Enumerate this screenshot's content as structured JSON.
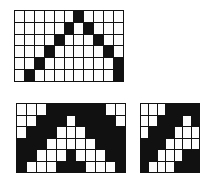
{
  "figure": {
    "colors": {
      "on": "#111111",
      "off": "#fdfdfd",
      "background": "#ffffff",
      "gridline": "#111111"
    },
    "legend": {
      "on_label": "filled cell",
      "off_label": "empty cell"
    },
    "grids": [
      {
        "name": "tent-outline",
        "caption": "",
        "columns": 11,
        "rows": 6,
        "cells": [
          [
            0,
            0,
            0,
            0,
            0,
            0,
            1,
            0,
            0,
            0,
            0
          ],
          [
            0,
            0,
            0,
            0,
            0,
            1,
            0,
            1,
            0,
            0,
            0
          ],
          [
            0,
            0,
            0,
            0,
            1,
            0,
            0,
            0,
            1,
            0,
            0
          ],
          [
            0,
            0,
            0,
            1,
            0,
            0,
            0,
            0,
            0,
            1,
            0
          ],
          [
            0,
            0,
            1,
            0,
            0,
            0,
            0,
            0,
            0,
            0,
            1
          ],
          [
            0,
            1,
            0,
            0,
            0,
            0,
            0,
            0,
            0,
            0,
            1
          ]
        ]
      },
      {
        "name": "tent-filled-inverse",
        "caption": "",
        "columns": 11,
        "rows": 6,
        "cells": [
          [
            0,
            0,
            0,
            1,
            1,
            1,
            1,
            1,
            1,
            0,
            0
          ],
          [
            0,
            0,
            1,
            1,
            1,
            0,
            1,
            1,
            1,
            1,
            0
          ],
          [
            0,
            1,
            1,
            1,
            0,
            0,
            0,
            1,
            1,
            1,
            1
          ],
          [
            1,
            1,
            1,
            0,
            0,
            0,
            0,
            0,
            1,
            1,
            1
          ],
          [
            1,
            1,
            0,
            0,
            0,
            1,
            0,
            0,
            0,
            1,
            1
          ],
          [
            1,
            0,
            0,
            0,
            1,
            1,
            1,
            0,
            0,
            0,
            1
          ]
        ]
      },
      {
        "name": "diagonal-fragment",
        "caption": "",
        "columns": 7,
        "rows": 6,
        "cells": [
          [
            0,
            0,
            0,
            1,
            1,
            1,
            1
          ],
          [
            0,
            0,
            1,
            1,
            1,
            0,
            1
          ],
          [
            0,
            1,
            1,
            1,
            0,
            0,
            0
          ],
          [
            1,
            1,
            1,
            0,
            0,
            0,
            0
          ],
          [
            1,
            1,
            0,
            0,
            0,
            1,
            1
          ],
          [
            1,
            0,
            0,
            0,
            1,
            1,
            1
          ]
        ]
      }
    ]
  }
}
